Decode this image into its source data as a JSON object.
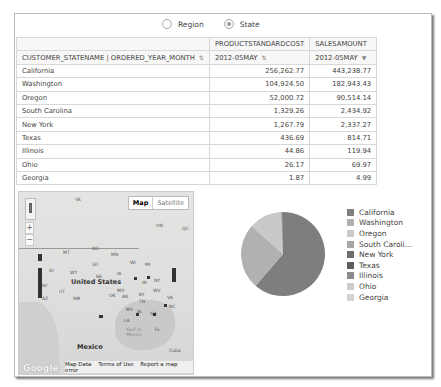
{
  "radio_group": {
    "options": [
      {
        "label": "Region",
        "selected": false
      },
      {
        "label": "State",
        "selected": true
      }
    ]
  },
  "table": {
    "header_row1": [
      "",
      "PRODUCTSTANDARDCOST",
      "SALESAMOUNT"
    ],
    "header_row2": [
      "CUSTOMER_STATENAME | ORDERED_YEAR_MONTH",
      "2012-05MAY",
      "2012-05MAY"
    ],
    "rows": [
      [
        "California",
        "256,262.77",
        "443,238.77"
      ],
      [
        "Washington",
        "104,924.50",
        "182,943.43"
      ],
      [
        "Oregon",
        "52,000.72",
        "90,514.14"
      ],
      [
        "South Carolina",
        "1,329.26",
        "2,434.92"
      ],
      [
        "New York",
        "1,267.79",
        "2,337.27"
      ],
      [
        "Texas",
        "436.69",
        "814.71"
      ],
      [
        "Illinois",
        "44.86",
        "119.94"
      ],
      [
        "Ohio",
        "26.17",
        "69.97"
      ],
      [
        "Georgia",
        "1.87",
        "4.99"
      ]
    ]
  },
  "map": {
    "type_buttons": {
      "map": "Map",
      "satellite": "Satellite"
    },
    "zoom_in": "+",
    "zoom_out": "−",
    "labels": {
      "sk": "SK",
      "on": "ON",
      "qc": "QC",
      "mt": "MT",
      "nd": "ND",
      "mn": "MN",
      "sd": "SD",
      "wi": "WI",
      "mi": "MI",
      "id": "ID",
      "wy": "WY",
      "ne": "NE",
      "ia": "IA",
      "nv": "NV",
      "ut": "UT",
      "il": "IL",
      "in": "IN",
      "oh": "OH",
      "mo": "MO",
      "ky": "KY",
      "wv": "WV",
      "va": "VA",
      "ny": "NY",
      "az": "AZ",
      "nm": "NM",
      "ok": "OK",
      "ar": "AR",
      "tn": "TN",
      "nc": "NC",
      "ms": "MS",
      "al": "AL",
      "ga": "GA",
      "la": "LA",
      "fl": "FL",
      "us": "United States",
      "mexico": "Mexico",
      "gulf": "Gulf of Mexico",
      "cuba": "Cuba"
    },
    "footer": {
      "logo": "Google",
      "map_data": "Map Data",
      "terms": "Terms of Use",
      "report": "Report a map error"
    }
  },
  "chart_data": {
    "type": "pie",
    "title": "",
    "categories": [
      "California",
      "Washington",
      "Oregon",
      "South Caroli...",
      "New York",
      "Texas",
      "Illinois",
      "Ohio",
      "Georgia"
    ],
    "values": [
      443238.77,
      182943.43,
      90514.14,
      2434.92,
      2337.27,
      814.71,
      119.94,
      69.97,
      4.99
    ],
    "colors": [
      "#7e7e7e",
      "#b1b1b1",
      "#c9c9c9",
      "#a6a6a6",
      "#6e6e6e",
      "#5e5e5e",
      "#8a8a8a",
      "#cdcdcd",
      "#d3d3d3"
    ],
    "legend_position": "right"
  }
}
